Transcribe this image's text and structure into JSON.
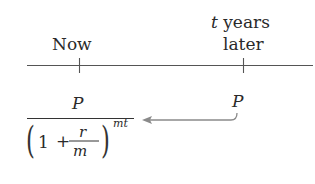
{
  "diagram": {
    "type": "timeline-present-value",
    "timeline": {
      "points": [
        {
          "id": "now",
          "label": "Now"
        },
        {
          "id": "later",
          "label_var": "t",
          "label_line1_rest": " years",
          "label_line2": "later"
        }
      ]
    },
    "values": {
      "future_value": "P",
      "present_value": {
        "numerator": "P",
        "base_one": "1",
        "plus": "+",
        "rate_num": "r",
        "rate_den": "m",
        "exponent": "mt",
        "left_paren": "(",
        "right_paren": ")"
      }
    },
    "arrow": {
      "from": "later",
      "to": "now",
      "meaning": "discount to present"
    },
    "colors": {
      "line": "#555555",
      "arrow": "#8a8a8a",
      "text": "#2a2a2a"
    }
  }
}
